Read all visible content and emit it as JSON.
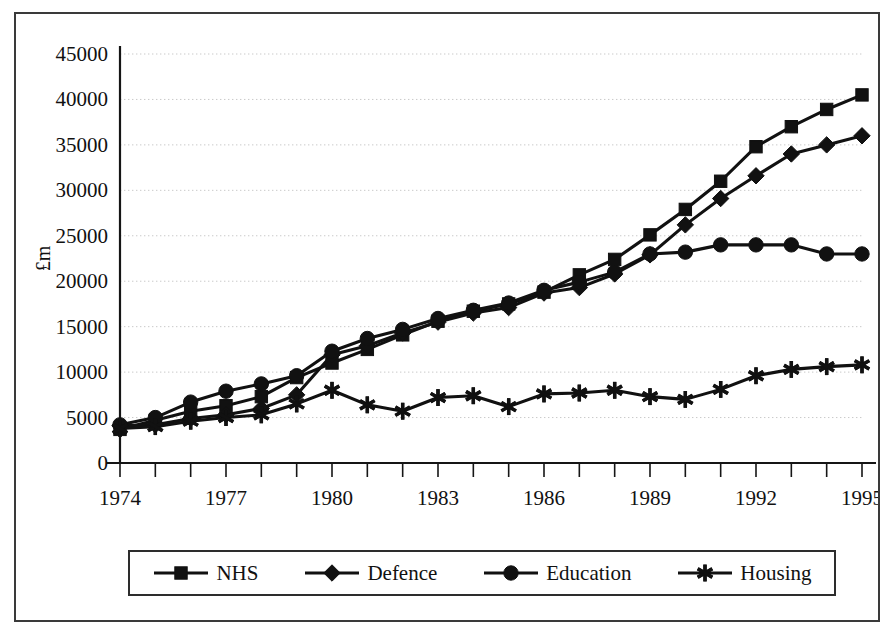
{
  "chart_data": {
    "type": "line",
    "title": "",
    "xlabel": "",
    "ylabel": "£m",
    "ylim": [
      0,
      45000
    ],
    "ytick_step": 5000,
    "yticks": [
      "0",
      "5000",
      "10000",
      "15000",
      "20000",
      "25000",
      "30000",
      "35000",
      "40000",
      "45000"
    ],
    "xlim": [
      1974,
      1995
    ],
    "xticks_all": [
      1974,
      1975,
      1976,
      1977,
      1978,
      1979,
      1980,
      1981,
      1982,
      1983,
      1984,
      1985,
      1986,
      1987,
      1988,
      1989,
      1990,
      1991,
      1992,
      1993,
      1994,
      1995
    ],
    "xtick_labels": [
      "1974",
      "1977",
      "1980",
      "1983",
      "1986",
      "1989",
      "1992",
      "1995"
    ],
    "xtick_label_years": [
      1974,
      1977,
      1980,
      1983,
      1986,
      1989,
      1992,
      1995
    ],
    "grid": true,
    "grid_axis": "y",
    "legend_position": "bottom",
    "x": [
      1974,
      1975,
      1976,
      1977,
      1978,
      1979,
      1980,
      1981,
      1982,
      1983,
      1984,
      1985,
      1986,
      1987,
      1988,
      1989,
      1990,
      1991,
      1992,
      1993,
      1994,
      1995
    ],
    "series": [
      {
        "name": "NHS",
        "marker": "square",
        "color": "#111111",
        "values": [
          3700,
          4700,
          5700,
          6300,
          7300,
          9400,
          11000,
          12500,
          14100,
          15600,
          16700,
          17500,
          18800,
          20700,
          22400,
          25100,
          27900,
          31000,
          34800,
          37000,
          38900,
          40500
        ]
      },
      {
        "name": "Defence",
        "marker": "diamond",
        "color": "#111111",
        "values": [
          4100,
          4200,
          4900,
          5300,
          6000,
          7500,
          11900,
          12900,
          14300,
          15500,
          16500,
          17100,
          18700,
          19300,
          20800,
          22900,
          26200,
          29100,
          31600,
          34000,
          35000,
          36000
        ]
      },
      {
        "name": "Education",
        "marker": "circle",
        "color": "#111111",
        "values": [
          4200,
          5000,
          6700,
          7900,
          8700,
          9600,
          12300,
          13700,
          14700,
          15900,
          16800,
          17600,
          19000,
          19900,
          21000,
          23000,
          23200,
          24000,
          24000,
          24000,
          23000,
          23000
        ]
      },
      {
        "name": "Housing",
        "marker": "asterisk",
        "color": "#111111",
        "values": [
          3800,
          4000,
          4600,
          5000,
          5300,
          6500,
          8000,
          6400,
          5700,
          7200,
          7400,
          6200,
          7600,
          7700,
          8000,
          7300,
          7000,
          8100,
          9600,
          10300,
          10600,
          10800
        ]
      }
    ],
    "note_defence_plateau": "Defence flattens near 24000 between 1992 and 1994 then falls to 23000 in 1995"
  },
  "legend": {
    "entries": [
      {
        "label": "NHS",
        "marker": "square"
      },
      {
        "label": "Defence",
        "marker": "diamond"
      },
      {
        "label": "Education",
        "marker": "circle"
      },
      {
        "label": "Housing",
        "marker": "asterisk"
      }
    ]
  },
  "colors": {
    "ink": "#111111",
    "border": "#3a3a3a",
    "grid": "#c9c9c9",
    "background": "#ffffff"
  }
}
